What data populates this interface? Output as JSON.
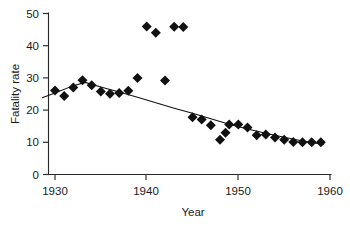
{
  "chart_data": {
    "type": "scatter",
    "title": "",
    "xlabel": "Year",
    "ylabel": "Fatality rate",
    "xlim": [
      1928.3,
      1960.5
    ],
    "ylim": [
      0,
      51
    ],
    "grid": false,
    "legend": "none",
    "xticks": [
      1930,
      1940,
      1950,
      1960
    ],
    "yticks": [
      0,
      10,
      20,
      30,
      40,
      50
    ],
    "marker": "diamond",
    "marker_color": "#111111",
    "series": [
      {
        "name": "Fatality rate",
        "x": [
          1930,
          1931,
          1932,
          1933,
          1934,
          1935,
          1936,
          1937,
          1938,
          1939,
          1940,
          1941,
          1942,
          1943,
          1944,
          1945,
          1946,
          1947,
          1948,
          1948.6,
          1949,
          1950,
          1951,
          1952,
          1953,
          1954,
          1955,
          1956,
          1957,
          1958,
          1959
        ],
        "y": [
          26.1,
          24.4,
          27.0,
          29.3,
          27.7,
          25.8,
          25.1,
          25.3,
          26.0,
          30.0,
          46.0,
          44.0,
          29.2,
          45.9,
          45.8,
          17.8,
          17.1,
          15.3,
          10.8,
          13.0,
          15.5,
          15.5,
          14.6,
          12.2,
          12.4,
          11.5,
          10.8,
          10.1,
          10.0,
          10.0,
          10.0
        ]
      }
    ],
    "trend_line": {
      "name": "fitted-trend",
      "x": [
        1928.6,
        1930,
        1932,
        1933.3,
        1935,
        1937,
        1939,
        1941,
        1943,
        1945,
        1947,
        1949,
        1951,
        1953,
        1955,
        1957,
        1959.3
      ],
      "y": [
        23.8,
        25.3,
        27.6,
        28.6,
        27.2,
        25.6,
        24.0,
        22.3,
        20.6,
        19.0,
        17.3,
        15.6,
        14.1,
        12.8,
        11.6,
        10.4,
        9.3
      ]
    }
  },
  "axis": {
    "y_tick_labels": [
      "0",
      "10",
      "20",
      "30",
      "40",
      "50"
    ],
    "x_tick_labels": [
      "1930",
      "1940",
      "1950",
      "1960"
    ],
    "y_title": "Fatality rate",
    "x_title": "Year"
  }
}
